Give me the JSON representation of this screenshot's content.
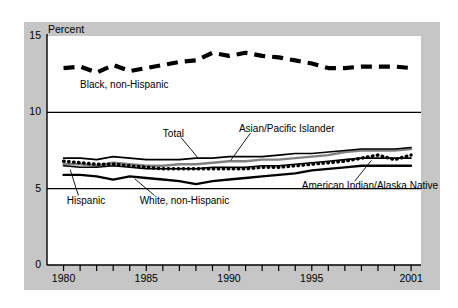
{
  "chart_data": {
    "type": "line",
    "title": "",
    "ylabel": "Percent",
    "xlabel": "",
    "ylim": [
      0,
      15
    ],
    "xlim": [
      1979,
      2001.6
    ],
    "yticks": [
      "0",
      "5",
      "10",
      "15"
    ],
    "ytick_values": [
      0,
      5,
      10,
      15
    ],
    "xticks": [
      "1980",
      "1985",
      "1990",
      "1995",
      "2001"
    ],
    "xtick_values": [
      1980,
      1985,
      1990,
      1995,
      2001
    ],
    "xtick_all": [
      1980,
      1981,
      1982,
      1983,
      1984,
      1985,
      1986,
      1987,
      1988,
      1989,
      1990,
      1991,
      1992,
      1993,
      1994,
      1995,
      1996,
      1997,
      1998,
      1999,
      2000,
      2001
    ],
    "grid": "horizontal gridlines at 5 and 10",
    "legend_position": "inline annotations",
    "x": [
      1980,
      1981,
      1982,
      1983,
      1984,
      1985,
      1986,
      1987,
      1988,
      1989,
      1990,
      1991,
      1992,
      1993,
      1994,
      1995,
      1996,
      1997,
      1998,
      1999,
      2000,
      2001
    ],
    "series": [
      {
        "name": "Black, non-Hispanic",
        "style": "thick-dashed",
        "color": "#000000",
        "values": [
          12.9,
          13.0,
          12.6,
          13.1,
          12.7,
          12.9,
          13.1,
          13.3,
          13.4,
          13.9,
          13.7,
          13.9,
          13.7,
          13.6,
          13.4,
          13.2,
          12.9,
          12.9,
          13.0,
          13.0,
          13.0,
          12.9
        ]
      },
      {
        "name": "Total",
        "style": "solid-thin",
        "color": "#000000",
        "values": [
          7.0,
          7.0,
          6.9,
          7.1,
          7.0,
          6.9,
          6.9,
          6.9,
          7.0,
          7.0,
          7.1,
          7.1,
          7.1,
          7.2,
          7.3,
          7.3,
          7.4,
          7.5,
          7.6,
          7.6,
          7.6,
          7.7
        ]
      },
      {
        "name": "Asian/Pacific Islander",
        "style": "solid-gray",
        "color": "#808080",
        "values": [
          6.6,
          6.6,
          6.5,
          6.7,
          6.6,
          6.5,
          6.5,
          6.6,
          6.6,
          6.7,
          6.8,
          6.8,
          6.9,
          6.9,
          7.0,
          7.1,
          7.2,
          7.4,
          7.5,
          7.5,
          7.5,
          7.6
        ]
      },
      {
        "name": "Hispanic",
        "style": "solid-thin",
        "color": "#000000",
        "values": [
          6.5,
          6.4,
          6.4,
          6.5,
          6.4,
          6.3,
          6.3,
          6.3,
          6.3,
          6.4,
          6.4,
          6.4,
          6.5,
          6.5,
          6.6,
          6.7,
          6.8,
          6.9,
          7.0,
          7.0,
          7.0,
          7.0
        ]
      },
      {
        "name": "White, non-Hispanic",
        "style": "solid-medium",
        "color": "#000000",
        "values": [
          5.9,
          5.9,
          5.8,
          5.6,
          5.8,
          5.7,
          5.6,
          5.5,
          5.3,
          5.5,
          5.6,
          5.7,
          5.8,
          5.9,
          6.0,
          6.2,
          6.3,
          6.4,
          6.5,
          6.5,
          6.5,
          6.5
        ]
      },
      {
        "name": "American Indian/Alaska Native",
        "style": "dotted",
        "color": "#000000",
        "values": [
          6.8,
          6.7,
          6.6,
          6.6,
          6.5,
          6.4,
          6.3,
          6.3,
          6.3,
          6.3,
          6.3,
          6.3,
          6.4,
          6.4,
          6.5,
          6.6,
          6.7,
          6.8,
          7.0,
          7.2,
          6.9,
          7.2
        ]
      }
    ],
    "annotations": [
      {
        "text": "Black, non-Hispanic",
        "x": 1981.0,
        "y": 11.8
      },
      {
        "text": "Total",
        "x": 1986.0,
        "y": 8.6
      },
      {
        "text": "Asian/Pacific Islander",
        "x": 1990.6,
        "y": 8.9
      },
      {
        "text": "Hispanic",
        "x": 1980.2,
        "y": 4.2
      },
      {
        "text": "White, non-Hispanic",
        "x": 1984.6,
        "y": 4.2
      },
      {
        "text": "American Indian/Alaska Native",
        "x": 1994.4,
        "y": 5.2
      }
    ]
  },
  "axis": {
    "y_title": "Percent",
    "y_tick_labels": [
      "15",
      "10",
      "5",
      "0"
    ],
    "x_tick_labels": [
      "1980",
      "1985",
      "1990",
      "1995",
      "2001"
    ]
  },
  "colors": {
    "frame": "#c6c6c6",
    "plot_background": "#ffffff",
    "line_black": "#000000",
    "line_gray": "#808080"
  }
}
